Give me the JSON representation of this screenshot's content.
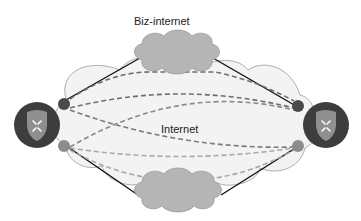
{
  "labels": {
    "biz_internet": "Biz-internet",
    "internet": "Internet"
  },
  "nodes": {
    "left_router": {
      "icon": "router-shield-icon"
    },
    "right_router": {
      "icon": "router-shield-icon"
    },
    "left_top_port": {
      "color": "#4a4a4a"
    },
    "left_bottom_port": {
      "color": "#8c8c8c"
    },
    "right_top_port": {
      "color": "#4a4a4a"
    },
    "right_bottom_port": {
      "color": "#8c8c8c"
    }
  },
  "colors": {
    "router_ring": "#3d3d3d",
    "shield": "#8f8f8f",
    "cloud_small": "#b5b5b5",
    "cloud_large": "#f3f3f3",
    "dashed_dark": "#6e6e6e",
    "dashed_light": "#a8a8a8",
    "solid_line": "#111111"
  }
}
